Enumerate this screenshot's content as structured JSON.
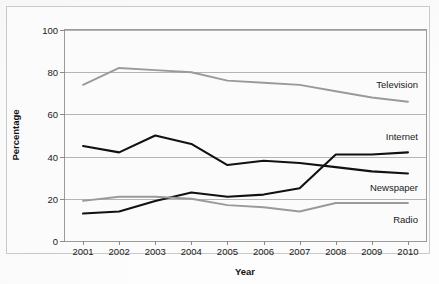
{
  "chart_data": {
    "type": "line",
    "title": "",
    "xlabel": "Year",
    "ylabel": "Percentage",
    "categories": [
      "2001",
      "2002",
      "2003",
      "2004",
      "2005",
      "2006",
      "2007",
      "2008",
      "2009",
      "2010"
    ],
    "x": [
      2001,
      2002,
      2003,
      2004,
      2005,
      2006,
      2007,
      2008,
      2009,
      2010
    ],
    "ylim": [
      0,
      100
    ],
    "yticks": [
      0,
      20,
      40,
      60,
      80,
      100
    ],
    "grid": true,
    "legend_position": "inline-right",
    "series": [
      {
        "name": "Television",
        "color": "#9a9a9a",
        "values": [
          74,
          82,
          81,
          80,
          76,
          75,
          74,
          71,
          68,
          66
        ]
      },
      {
        "name": "Internet",
        "color": "#111111",
        "values": [
          13,
          14,
          19,
          23,
          21,
          22,
          25,
          41,
          41,
          42
        ]
      },
      {
        "name": "Newspaper",
        "color": "#111111",
        "values": [
          45,
          42,
          50,
          46,
          36,
          38,
          37,
          35,
          33,
          32
        ]
      },
      {
        "name": "Radio",
        "color": "#9a9a9a",
        "values": [
          19,
          21,
          21,
          20,
          17,
          16,
          14,
          18,
          18,
          18
        ]
      }
    ]
  },
  "axes": {
    "y_title": "Percentage",
    "x_title": "Year",
    "y_tick_labels": [
      "0",
      "20",
      "40",
      "60",
      "80",
      "100"
    ],
    "x_tick_labels": [
      "2001",
      "2002",
      "2003",
      "2004",
      "2005",
      "2006",
      "2007",
      "2008",
      "2009",
      "2010"
    ]
  },
  "series_labels": [
    {
      "text": "Television"
    },
    {
      "text": "Internet"
    },
    {
      "text": "Newspaper"
    },
    {
      "text": "Radio"
    }
  ],
  "colors": {
    "gray_series": "#9a9a9a",
    "black_series": "#111111",
    "gridline": "#b4b4b4",
    "frame": "#c9c9c9",
    "plot_border": "#9a9a9a"
  },
  "background_text": [
    {
      "text": "nited news source are there or more"
    },
    {
      "text": "spects correct. The poor sense of"
    },
    {
      "text": "information sources are"
    },
    {
      "text": "her reading"
    },
    {
      "text": "alien desire for 100 by their history"
    },
    {
      "text": "newest readership survey"
    }
  ]
}
